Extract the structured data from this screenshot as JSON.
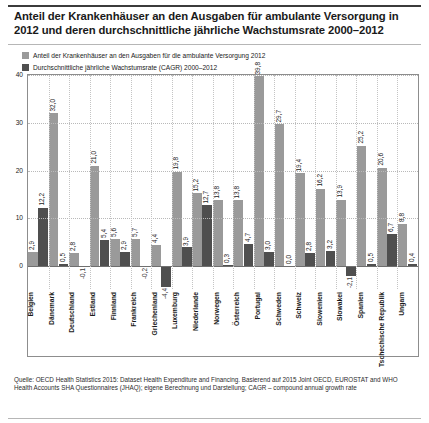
{
  "title": "Anteil der Krankenhäuser an den Ausgaben für ambulante Versorgung in 2012 und deren durchschnittliche jährliche Wachstumsrate 2000–2012",
  "legend": [
    {
      "label": "Anteil der Krankenhäuser an den Ausgaben für die ambulante Versorgung 2012",
      "color": "#9a9a9a",
      "swatch_name": "legend-swatch-share"
    },
    {
      "label": "Durchschnittliche jährliche Wachstumsrate (CAGR) 2000–2012",
      "color": "#4f4f4f",
      "swatch_name": "legend-swatch-cagr"
    }
  ],
  "source": "Quelle: OECD Health Statistics 2015: Dataset Health Expenditure and Financing. Basierend auf 2015 Joint OECD, EUROSTAT and WHO Health Accounts SHA Questionnaires (JHAQ); eigene Berechnung und Darstellung; CAGR – compound annual growth rate",
  "chart_data": {
    "type": "bar",
    "title": "Anteil der Krankenhäuser an den Ausgaben für ambulante Versorgung in 2012 und deren durchschnittliche jährliche Wachstumsrate 2000–2012",
    "xlabel": "",
    "ylabel": "",
    "ylim": [
      -5,
      40
    ],
    "yticks": [
      "0",
      "10",
      "20",
      "30",
      "40"
    ],
    "ytick_values": [
      0,
      10,
      20,
      30,
      40
    ],
    "grid": true,
    "legend_position": "top-left",
    "decimal_separator": ",",
    "categories": [
      "Belgien",
      "Dänemark",
      "Deutschland",
      "Estland",
      "Finnland",
      "Frankreich",
      "Griechenland",
      "Luxemburg",
      "Niederlande",
      "Norwegen",
      "Österreich",
      "Portugal",
      "Schweden",
      "Schweiz",
      "Slowenien",
      "Slowakei",
      "Spanien",
      "Tschechische Republik",
      "Ungarn"
    ],
    "series": [
      {
        "name": "Anteil der Krankenhäuser an den Ausgaben für die ambulante Versorgung 2012",
        "color": "#9a9a9a",
        "values": [
          2.9,
          32.0,
          2.8,
          21.0,
          5.6,
          5.7,
          4.4,
          19.8,
          15.2,
          13.8,
          13.8,
          39.8,
          29.7,
          19.4,
          16.2,
          13.9,
          25.2,
          20.6,
          8.8
        ],
        "labels": [
          "2,9",
          "32,0",
          "2,8",
          "21,0",
          "5,6",
          "5,7",
          "4,4",
          "19,8",
          "15,2",
          "13,8",
          "13,8",
          "39,8",
          "29,7",
          "19,4",
          "16,2",
          "13,9",
          "25,2",
          "20,6",
          "8,8"
        ]
      },
      {
        "name": "Durchschnittliche jährliche Wachstumsrate (CAGR) 2000–2012",
        "color": "#4f4f4f",
        "values": [
          12.2,
          0.5,
          -0.1,
          5.4,
          2.9,
          -0.2,
          -4.4,
          3.9,
          12.7,
          0.3,
          4.7,
          3.0,
          0.0,
          2.8,
          3.2,
          -2.1,
          0.5,
          6.7,
          0.4
        ],
        "labels": [
          "12,2",
          "0,5",
          "-0,1",
          "5,4",
          "2,9",
          "-0,2",
          "-4,4",
          "3,9",
          "12,7",
          "0,3",
          "4,7",
          "3,0",
          "0,0",
          "2,8",
          "3,2",
          "-2,1",
          "0,5",
          "6,7",
          "0,4"
        ]
      }
    ]
  }
}
